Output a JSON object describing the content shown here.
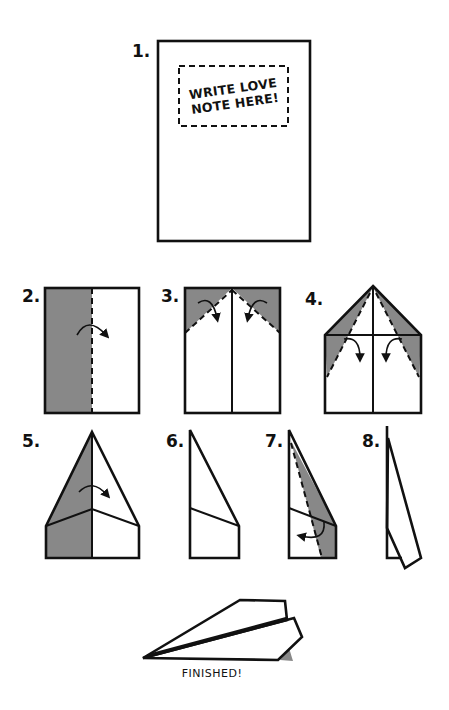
{
  "colors": {
    "outline": "#111111",
    "shade": "#888888",
    "background": "#ffffff"
  },
  "steps": [
    {
      "number": "1.",
      "note_line1": "WRITE LOVE",
      "note_line2": "NOTE HERE!"
    },
    {
      "number": "2."
    },
    {
      "number": "3."
    },
    {
      "number": "4."
    },
    {
      "number": "5."
    },
    {
      "number": "6."
    },
    {
      "number": "7."
    },
    {
      "number": "8."
    }
  ],
  "finished": {
    "caption": "FINISHED!"
  }
}
